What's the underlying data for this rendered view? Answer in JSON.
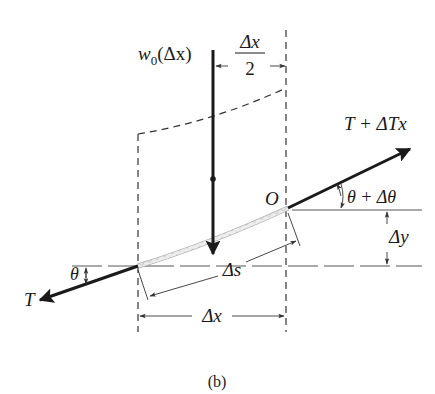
{
  "figure": {
    "caption": "(b)",
    "labels": {
      "load": "w",
      "load_sub": "0",
      "load_arg": "(Δx)",
      "half_dx_num": "Δx",
      "half_dx_den": "2",
      "tension_right": "T + ΔTx",
      "angle_right": "θ + Δθ",
      "origin": "O",
      "dy": "Δy",
      "ds": "Δs",
      "dx": "Δx",
      "angle_left": "θ",
      "tension_left": "T"
    },
    "colors": {
      "ink": "#1a1a1a",
      "line_gray": "#555555",
      "cable_fill": "#e6e6e6"
    }
  }
}
